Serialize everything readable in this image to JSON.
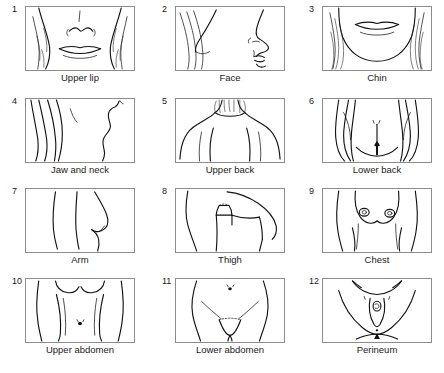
{
  "figure": {
    "panel_count": 12,
    "columns": 3,
    "rows": 4,
    "border_color": "#8c8c8c",
    "ink_color": "#111111",
    "background_color": "#ffffff"
  },
  "panels": [
    {
      "number": "1",
      "caption": "Upper lip",
      "icon": "upper-lip-illustration"
    },
    {
      "number": "2",
      "caption": "Face",
      "icon": "face-profile-illustration"
    },
    {
      "number": "3",
      "caption": "Chin",
      "icon": "chin-illustration"
    },
    {
      "number": "4",
      "caption": "Jaw and neck",
      "icon": "jaw-and-neck-illustration"
    },
    {
      "number": "5",
      "caption": "Upper back",
      "icon": "upper-back-illustration"
    },
    {
      "number": "6",
      "caption": "Lower back",
      "icon": "lower-back-illustration"
    },
    {
      "number": "7",
      "caption": "Arm",
      "icon": "arm-illustration"
    },
    {
      "number": "8",
      "caption": "Thigh",
      "icon": "thigh-illustration"
    },
    {
      "number": "9",
      "caption": "Chest",
      "icon": "chest-illustration"
    },
    {
      "number": "10",
      "caption": "Upper abdomen",
      "icon": "upper-abdomen-illustration"
    },
    {
      "number": "11",
      "caption": "Lower abdomen",
      "icon": "lower-abdomen-illustration"
    },
    {
      "number": "12",
      "caption": "Perineum",
      "icon": "perineum-illustration"
    }
  ]
}
